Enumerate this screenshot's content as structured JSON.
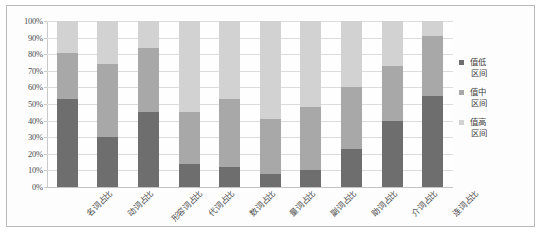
{
  "chart_data": {
    "type": "bar",
    "subtype": "100% stacked bar",
    "title": "",
    "xlabel": "",
    "ylabel": "",
    "ylim": [
      0,
      100
    ],
    "ytick_labels": [
      "100%",
      "90%",
      "80%",
      "70%",
      "60%",
      "50%",
      "40%",
      "30%",
      "20%",
      "10%",
      "0%"
    ],
    "ytick_values": [
      100,
      90,
      80,
      70,
      60,
      50,
      40,
      30,
      20,
      10,
      0
    ],
    "grid": true,
    "legend_position": "right",
    "categories": [
      "名词占比",
      "动词占比",
      "形容词占比",
      "代词占比",
      "数词占比",
      "量词占比",
      "副词占比",
      "助词占比",
      "介词占比",
      "连词占比"
    ],
    "series": [
      {
        "name": "值低区间",
        "color": "#6e6e6e",
        "values": [
          53,
          30,
          45,
          14,
          12,
          8,
          10,
          23,
          40,
          55
        ]
      },
      {
        "name": "值中区间",
        "color": "#a8a8a8",
        "values": [
          28,
          44,
          39,
          31,
          41,
          33,
          38,
          37,
          33,
          36
        ]
      },
      {
        "name": "值高区间",
        "color": "#d2d2d2",
        "values": [
          19,
          26,
          16,
          55,
          47,
          59,
          52,
          40,
          27,
          9
        ]
      }
    ]
  },
  "legend": {
    "items": [
      {
        "line1": "值低",
        "line2": "区间",
        "color": "#6e6e6e"
      },
      {
        "line1": "值中",
        "line2": "区间",
        "color": "#a8a8a8"
      },
      {
        "line1": "值高",
        "line2": "区间",
        "color": "#d2d2d2"
      }
    ]
  },
  "colors": {
    "low": "#6e6e6e",
    "mid": "#a8a8a8",
    "high": "#d2d2d2",
    "grid": "#dcdcdc",
    "border": "#b9b9b9"
  }
}
